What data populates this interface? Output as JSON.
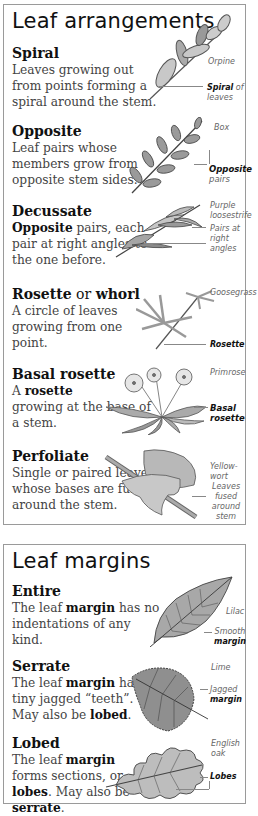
{
  "arrangements": {
    "title": "Leaf arrangements",
    "entries": [
      {
        "heading": "Spiral",
        "description": "Leaves growing out from points forming a spiral around the stem.",
        "species": "Orpine",
        "callout_bold": "Spiral",
        "callout_rest": " of leaves"
      },
      {
        "heading": "Opposite",
        "description": "Leaf pairs whose members grow from opposite stem sides.",
        "species": "Box",
        "callout_bold": "Opposite",
        "callout_rest": " pairs"
      },
      {
        "heading": "Decussate",
        "description_bold": "Opposite",
        "description_rest": " pairs, each pair at right angles to the one before.",
        "species": "Purple loosestrife",
        "callout": "Pairs at right angles"
      },
      {
        "heading": "Rosette",
        "heading_joiner": " or ",
        "heading_alt": "whorl",
        "description": "A circle of leaves growing from one point.",
        "species": "Goosegrass",
        "callout_bold": "Rosette"
      },
      {
        "heading": "Basal rosette",
        "description_pre": "A ",
        "description_bold": "rosette",
        "description_rest": " growing at the base of a stem.",
        "species": "Primrose",
        "callout_bold": "Basal rosette"
      },
      {
        "heading": "Perfoliate",
        "description": "Single or paired leaves whose bases are fused around the stem.",
        "species": "Yellow-wort",
        "callout": "Leaves fused around stem"
      }
    ]
  },
  "margins": {
    "title": "Leaf margins",
    "entries": [
      {
        "heading": "Entire",
        "description_pre": "The leaf ",
        "description_bold": "margin",
        "description_rest": " has no indentations of any kind.",
        "species": "Lilac",
        "callout": "Smooth",
        "callout_bold": "margin"
      },
      {
        "heading": "Serrate",
        "description_pre": "The leaf ",
        "description_bold": "margin",
        "description_mid": " has tiny jagged “teeth”. May also be ",
        "description_bold2": "lobed",
        "description_end": ".",
        "species": "Lime",
        "callout": "Jagged",
        "callout_bold": "margin"
      },
      {
        "heading": "Lobed",
        "description_pre": "The leaf ",
        "description_bold": "margin",
        "description_mid": " forms sections, or ",
        "description_bold2": "lobes",
        "description_mid2": ". May also be ",
        "description_bold3": "serrate",
        "description_end": ".",
        "species": "English oak",
        "callout_bold": "Lobes"
      }
    ]
  },
  "colors": {
    "leaf_fill": "#b9b9b9",
    "leaf_dark": "#8a8a8a",
    "outline": "#555555",
    "border": "#9a9a9a"
  }
}
